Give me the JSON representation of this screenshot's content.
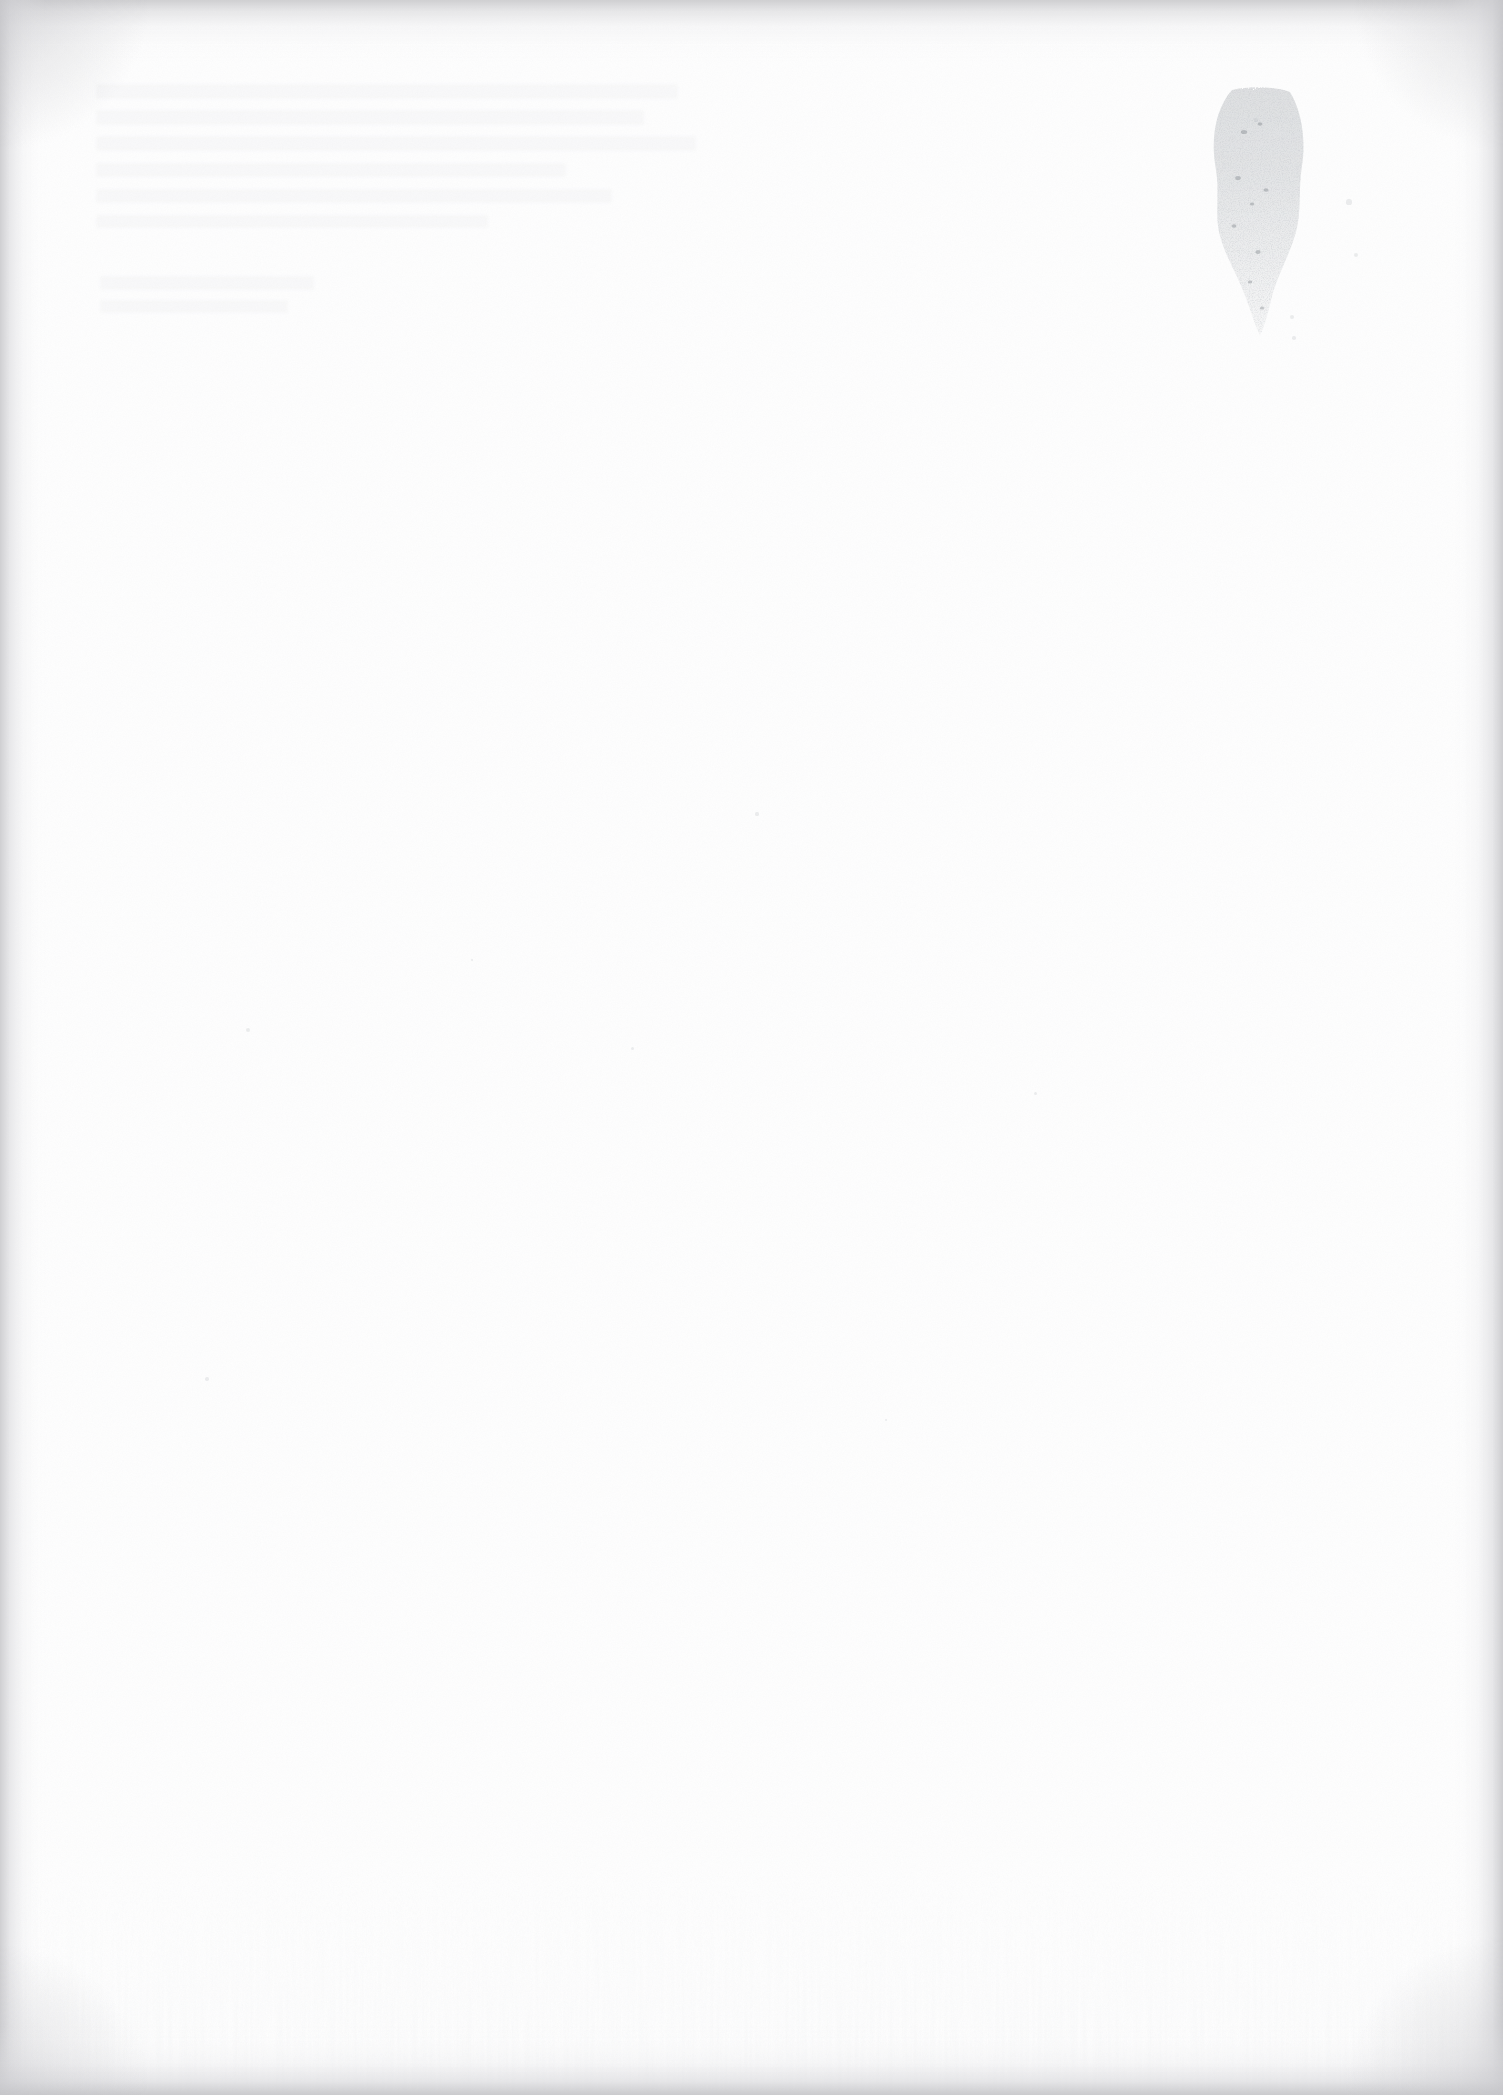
{
  "document": {
    "kind": "scanned-page",
    "content_state": "blank",
    "page_width_px": 1503,
    "page_height_px": 2095,
    "visible_text": "",
    "text_legible": false,
    "notes_rendered_on_screen": "no text, headings, numbers, captions, page numbers or UI chrome are legible anywhere on this page"
  },
  "colors": {
    "paper": "#fefefe",
    "page_background": "#ffffff",
    "edge_shadow": "#cdcdcf",
    "edge_shadow_deep": "#c4c4c8",
    "stain_ink": "#8f959b",
    "ghost_text": "#9aa0a6",
    "speck": "#aeb2b6"
  },
  "artifacts": [
    {
      "id": "edge-vignette",
      "label": "scanner edge shadow",
      "description": "soft gray gradient band along the top, left, right and bottom edges of the scan, deepening at the four corners",
      "edges": [
        "top",
        "left",
        "right",
        "bottom"
      ],
      "top_height_px": 62,
      "left_width_px": 46,
      "right_width_px": 52,
      "bottom_height_px": 70
    },
    {
      "id": "ink-stain",
      "label": "ink stain / smudge",
      "description": "irregular speckled grayish stain in the upper-right quadrant, broad at the top and tapering downward to a narrow tail; no legible characters",
      "x_px": 1186,
      "y_px": 86,
      "width_px": 148,
      "height_px": 250,
      "opacity": "faint"
    },
    {
      "id": "ghost-show-through",
      "label": "reverse-side show-through",
      "description": "extremely faint horizontal ghost rows of text bleeding through from the opposite side of the sheet in the upper-left quadrant; completely illegible",
      "x_px": 90,
      "y_px": 78,
      "width_px": 700,
      "height_px": 240,
      "opacity": "very faint"
    },
    {
      "id": "paper-grain",
      "label": "paper grain noise",
      "description": "very light speckled scanner/paper texture spread across the whole sheet"
    },
    {
      "id": "bottom-streaks",
      "label": "vertical scanner streaks",
      "description": "subtle vertical lighter/darker streaking in the lower portion of the scan"
    }
  ],
  "speck_positions": [
    {
      "x": 1349,
      "y": 202,
      "r": 2.6
    },
    {
      "x": 1356,
      "y": 255,
      "r": 2.0
    },
    {
      "x": 1292,
      "y": 317,
      "r": 2.4
    },
    {
      "x": 1294,
      "y": 338,
      "r": 1.8
    },
    {
      "x": 1256,
      "y": 120,
      "r": 1.6
    },
    {
      "x": 248,
      "y": 1030,
      "r": 2.0
    },
    {
      "x": 207,
      "y": 1379,
      "r": 1.8
    },
    {
      "x": 757,
      "y": 814,
      "r": 1.6
    },
    {
      "x": 1035,
      "y": 1093,
      "r": 1.5
    },
    {
      "x": 632,
      "y": 1048,
      "r": 1.5
    },
    {
      "x": 472,
      "y": 960,
      "r": 1.4
    },
    {
      "x": 886,
      "y": 1420,
      "r": 1.4
    }
  ],
  "ghost_lines": [
    {
      "x": 96,
      "y": 84,
      "w": 582,
      "h": 15
    },
    {
      "x": 96,
      "y": 110,
      "w": 548,
      "h": 15
    },
    {
      "x": 96,
      "y": 136,
      "w": 600,
      "h": 15
    },
    {
      "x": 96,
      "y": 163,
      "w": 470,
      "h": 14
    },
    {
      "x": 96,
      "y": 189,
      "w": 516,
      "h": 14
    },
    {
      "x": 96,
      "y": 215,
      "w": 392,
      "h": 13
    },
    {
      "x": 100,
      "y": 276,
      "w": 214,
      "h": 14
    },
    {
      "x": 100,
      "y": 300,
      "w": 188,
      "h": 13
    }
  ]
}
